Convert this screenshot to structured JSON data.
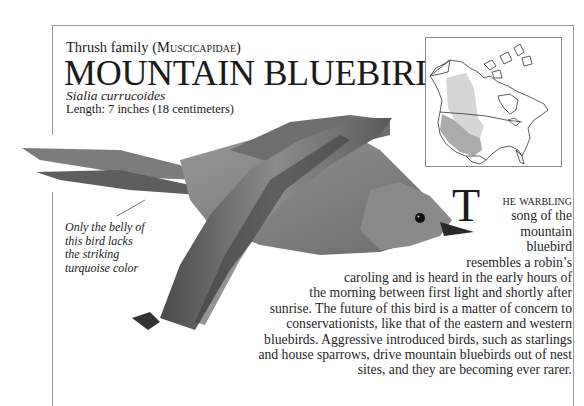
{
  "header": {
    "family_prefix": "Thrush family (",
    "family_latin": "Muscicapidae",
    "family_suffix": ")",
    "title": "MOUNTAIN BLUEBIRD",
    "species_latin": "Sialia currucoides",
    "length": "Length: 7 inches (18 centimeters)"
  },
  "map": {
    "label": "range-map-north-america",
    "summer_range_color": "#d4d4d4",
    "year_round_range_color": "#a8a8a8"
  },
  "caption": {
    "lines": [
      "Only the belly of",
      "this bird lacks",
      "the striking",
      "turquoise color"
    ]
  },
  "body": {
    "dropcap": "T",
    "first_line_smallcaps": "he warbling",
    "lines": [
      "song of the",
      "mountain",
      "bluebird",
      "resembles a robin’s",
      "caroling and is heard in the early hours of",
      "the morning between first light and shortly after",
      "sunrise. The future of this bird is a matter of concern to",
      "conservationists, like that of the eastern and western",
      "bluebirds. Aggressive introduced birds, such as starlings",
      "and house sparrows, drive mountain bluebirds out of nest",
      "sites, and they are becoming ever rarer."
    ]
  },
  "colors": {
    "frame": "#9a9a9a",
    "text": "#1a1a1a"
  }
}
